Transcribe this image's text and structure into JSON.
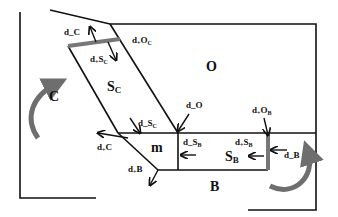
{
  "regions": {
    "C": "C",
    "O": "O",
    "S_C": "S",
    "S_C_sub": "C",
    "m": "m",
    "S_B": "S",
    "S_B_sub": "B",
    "B": "B"
  },
  "flux_labels": {
    "d_minus_C": "d_C",
    "d_plus_O_C": "d",
    "d_plus_O_C_mid": "O",
    "d_plus_O_C_sub": "C",
    "d_plus_S_C": "d",
    "d_plus_S_C_mid": "S",
    "d_plus_S_C_sub": "C",
    "d_minus_S_C": "d_S",
    "d_minus_S_C_sub": "C",
    "d_minus_O": "d_O",
    "d_plus_C": "d",
    "d_plus_C_mid": "C",
    "d_plus_B": "d",
    "d_plus_B_mid": "B",
    "d_minus_S_B": "d_S",
    "d_minus_S_B_sub": "B",
    "d_plus_S_B": "d",
    "d_plus_S_B_mid": "S",
    "d_plus_S_B_sub": "B",
    "d_plus_O_B": "d",
    "d_plus_O_B_mid": "O",
    "d_plus_O_B_sub": "B",
    "d_minus_B": "d_B",
    "plus_sign": "+"
  },
  "colors": {
    "line": "#111111",
    "membrane_bar": "#777777",
    "rotation_arrow": "#6e6e6e"
  }
}
